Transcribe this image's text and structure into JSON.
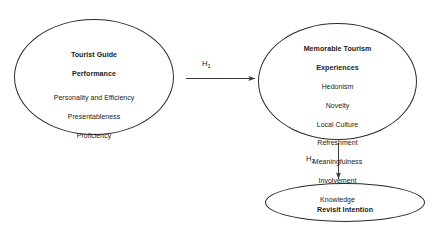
{
  "diagram": {
    "nodes": {
      "tourist_guide_performance": {
        "title_line1": "Tourist Guide",
        "title_line2": "Performance",
        "items": [
          "Personality and Efficiency",
          "Presentableness",
          "Proficiency"
        ]
      },
      "memorable_tourism_experiences": {
        "title_line1": "Memorable Tourism",
        "title_line2": "Experiences",
        "items": [
          "Hedonism",
          "Novelty",
          "Local Culture",
          "Refreshment",
          "Meaningfulness",
          "Involvement",
          "Knowledge"
        ]
      },
      "revisit_intention": {
        "title": "Revisit Intention"
      }
    },
    "hypotheses": {
      "h1": {
        "letter": "H",
        "subscript": "1"
      },
      "h2": {
        "letter": "H",
        "subscript": "2"
      }
    },
    "colors": {
      "stroke": "#2b2b2b",
      "arrow": "#3a3a3a",
      "text": "#1a1a1a",
      "background": "#ffffff"
    }
  }
}
